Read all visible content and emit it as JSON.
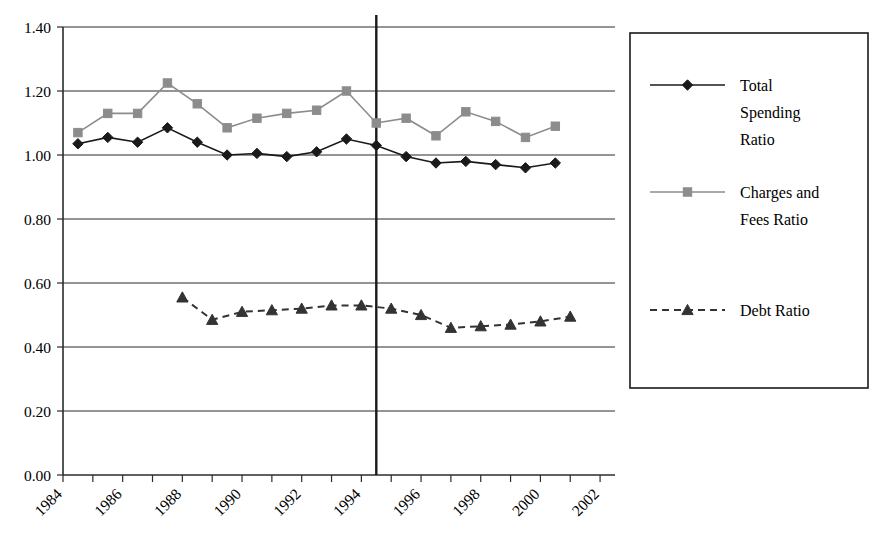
{
  "chart_data": {
    "type": "line",
    "title": "",
    "subtitle": "",
    "xlabel": "",
    "ylabel": "",
    "xlim": [
      1984,
      2002.5
    ],
    "ylim": [
      0.0,
      1.4
    ],
    "yticks": [
      "0.00",
      "0.20",
      "0.40",
      "0.60",
      "0.80",
      "1.00",
      "1.20",
      "1.40"
    ],
    "ytick_values": [
      0.0,
      0.2,
      0.4,
      0.6,
      0.8,
      1.0,
      1.2,
      1.4
    ],
    "xticks": [
      "1984",
      "1986",
      "1988",
      "1990",
      "1992",
      "1994",
      "1996",
      "1998",
      "2000",
      "2002"
    ],
    "xtick_values": [
      1984,
      1986,
      1988,
      1990,
      1992,
      1994,
      1996,
      1998,
      2000,
      2002
    ],
    "grid": "horizontal",
    "legend_position": "right",
    "annotations": [
      {
        "name": "period-divider",
        "type": "vline",
        "x": 1994.5,
        "label": ""
      }
    ],
    "series": [
      {
        "name": "Total Spending Ratio",
        "marker": "diamond",
        "color": "#1a1a1a",
        "linestyle": "solid",
        "x": [
          1984.5,
          1985.5,
          1986.5,
          1987.5,
          1988.5,
          1989.5,
          1990.5,
          1991.5,
          1992.5,
          1993.5,
          1994.5,
          1995.5,
          1996.5,
          1997.5,
          1998.5,
          1999.5,
          2000.5
        ],
        "values": [
          1.035,
          1.055,
          1.04,
          1.085,
          1.04,
          1.0,
          1.005,
          0.995,
          1.01,
          1.05,
          1.03,
          0.995,
          0.975,
          0.98,
          0.97,
          0.96,
          0.975
        ]
      },
      {
        "name": "Charges and Fees Ratio",
        "marker": "square",
        "color": "#8c8c8c",
        "linestyle": "solid",
        "x": [
          1984.5,
          1985.5,
          1986.5,
          1987.5,
          1988.5,
          1989.5,
          1990.5,
          1991.5,
          1992.5,
          1993.5,
          1994.5,
          1995.5,
          1996.5,
          1997.5,
          1998.5,
          1999.5,
          2000.5
        ],
        "values": [
          1.07,
          1.13,
          1.13,
          1.225,
          1.16,
          1.085,
          1.115,
          1.13,
          1.14,
          1.2,
          1.1,
          1.115,
          1.06,
          1.135,
          1.105,
          1.055,
          1.09
        ]
      },
      {
        "name": "Debt Ratio",
        "marker": "triangle",
        "color": "#333333",
        "linestyle": "dashed",
        "x": [
          1988.0,
          1989.0,
          1990.0,
          1991.0,
          1992.0,
          1993.0,
          1994.0,
          1995.0,
          1996.0,
          1997.0,
          1998.0,
          1999.0,
          2000.0,
          2001.0
        ],
        "values": [
          0.555,
          0.485,
          0.51,
          0.515,
          0.52,
          0.53,
          0.53,
          0.52,
          0.5,
          0.46,
          0.465,
          0.47,
          0.48,
          0.495
        ]
      }
    ]
  },
  "legend": {
    "entries": [
      {
        "label": "Total Spending Ratio",
        "marker": "diamond",
        "color": "#1a1a1a",
        "linestyle": "solid"
      },
      {
        "label": "Charges and Fees Ratio",
        "marker": "square",
        "color": "#8c8c8c",
        "linestyle": "solid"
      },
      {
        "label": "Debt Ratio",
        "marker": "triangle",
        "color": "#333333",
        "linestyle": "dashed"
      }
    ]
  },
  "axes": {
    "y_label_0": "0.00",
    "y_label_1": "0.20",
    "y_label_2": "0.40",
    "y_label_3": "0.60",
    "y_label_4": "0.80",
    "y_label_5": "1.00",
    "y_label_6": "1.20",
    "y_label_7": "1.40"
  }
}
